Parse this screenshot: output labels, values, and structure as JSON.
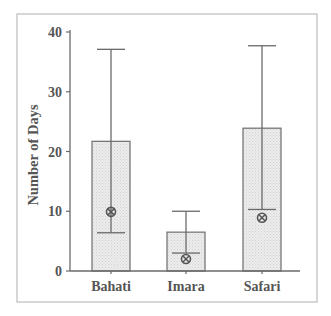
{
  "chart_data": {
    "type": "bar",
    "title": "",
    "xlabel": "",
    "ylabel": "Number of Days",
    "ylim": [
      0,
      40
    ],
    "yticks": [
      0,
      10,
      20,
      30,
      40
    ],
    "grid": false,
    "legend": null,
    "categories": [
      "Bahati",
      "Imara",
      "Safari"
    ],
    "series": [
      {
        "name": "Mean",
        "values": [
          21.7,
          6.5,
          23.9
        ],
        "error_upper": [
          37.1,
          10.0,
          37.7
        ],
        "error_lower": [
          6.4,
          3.0,
          10.3
        ]
      },
      {
        "name": "Median (circled X marker)",
        "values": [
          9.9,
          2.0,
          8.9
        ]
      }
    ]
  },
  "colors": {
    "bar_fill": "#e8e8e8",
    "bar_stroke": "#777777",
    "axis": "#6a6a6a",
    "text": "#555555",
    "frame": "#bdbdbd"
  },
  "labels": {
    "ylabel": "Number of Days",
    "yticks": [
      "0",
      "10",
      "20",
      "30",
      "40"
    ],
    "categories": [
      "Bahati",
      "Imara",
      "Safari"
    ]
  }
}
